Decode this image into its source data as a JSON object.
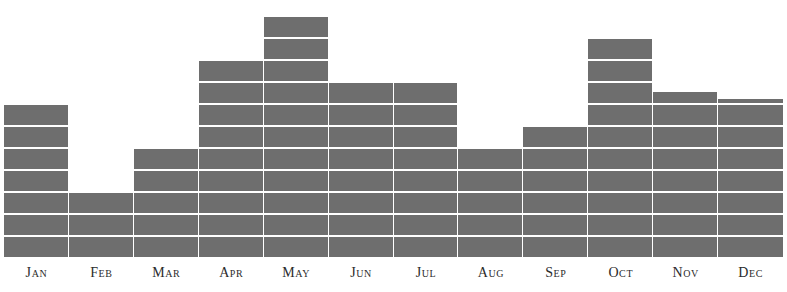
{
  "chart_data": {
    "type": "bar",
    "title": "",
    "subtitle": "",
    "xlabel": "",
    "ylabel": "",
    "categories": [
      "Jan",
      "Feb",
      "Mar",
      "Apr",
      "May",
      "Jun",
      "Jul",
      "Aug",
      "Sep",
      "Oct",
      "Nov",
      "Dec"
    ],
    "values": [
      7,
      3,
      5,
      9,
      11,
      8,
      8,
      5,
      6,
      10,
      7.5,
      7.2
    ],
    "ylim": [
      0,
      11.7
    ],
    "grid": true,
    "grid_orientation": "horizontal-bands",
    "band_unit": 1,
    "legend": "none",
    "legend_position": "none",
    "annotations": [],
    "tick_labels_y": [],
    "series": [
      {
        "name": "value",
        "values": [
          7,
          3,
          5,
          9,
          11,
          8,
          8,
          5,
          6,
          10,
          7.5,
          7.2
        ]
      }
    ]
  },
  "style": {
    "bar_color": "#6e6e6e",
    "separator_color": "#ffffff",
    "background_color": "#ffffff",
    "label_color": "#2b2b2b"
  },
  "axis": {
    "labels": [
      {
        "text": "Jan"
      },
      {
        "text": "Feb"
      },
      {
        "text": "Mar"
      },
      {
        "text": "Apr"
      },
      {
        "text": "May"
      },
      {
        "text": "Jun"
      },
      {
        "text": "Jul"
      },
      {
        "text": "Aug"
      },
      {
        "text": "Sep"
      },
      {
        "text": "Oct"
      },
      {
        "text": "Nov"
      },
      {
        "text": "Dec"
      }
    ]
  }
}
